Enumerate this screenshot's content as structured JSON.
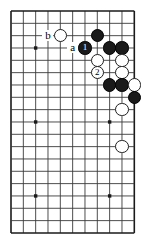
{
  "figure": {
    "kind": "go-board-diagram",
    "background_color": "#ffffff",
    "line_color": "#3a3a3a",
    "edge_color": "#1a1a1a",
    "black_color": "#1a1a1a",
    "white_color": "#ffffff"
  },
  "board": {
    "columns": 11,
    "rows": 19,
    "origin_x": 11,
    "origin_y": 11,
    "spacing": 12.33,
    "edges": {
      "top": true,
      "left": true,
      "right": true,
      "bottom": true
    },
    "star_points": [
      {
        "col": 2,
        "row": 3
      },
      {
        "col": 2,
        "row": 9
      },
      {
        "col": 2,
        "row": 15
      },
      {
        "col": 8,
        "row": 9
      },
      {
        "col": 8,
        "row": 15
      }
    ]
  },
  "stones": [
    {
      "col": 4,
      "row": 2,
      "color": "white",
      "label": ""
    },
    {
      "col": 7,
      "row": 2,
      "color": "black",
      "label": ""
    },
    {
      "col": 6,
      "row": 3,
      "color": "black",
      "label": "1"
    },
    {
      "col": 8,
      "row": 3,
      "color": "black",
      "label": ""
    },
    {
      "col": 9,
      "row": 3,
      "color": "black",
      "label": ""
    },
    {
      "col": 7,
      "row": 4,
      "color": "white",
      "label": ""
    },
    {
      "col": 9,
      "row": 4,
      "color": "white",
      "label": ""
    },
    {
      "col": 7,
      "row": 5,
      "color": "white",
      "label": "2"
    },
    {
      "col": 9,
      "row": 5,
      "color": "white",
      "label": ""
    },
    {
      "col": 8,
      "row": 6,
      "color": "black",
      "label": ""
    },
    {
      "col": 9,
      "row": 6,
      "color": "black",
      "label": ""
    },
    {
      "col": 10,
      "row": 6,
      "color": "white",
      "label": ""
    },
    {
      "col": 10,
      "row": 7,
      "color": "black",
      "label": ""
    },
    {
      "col": 9,
      "row": 8,
      "color": "white",
      "label": ""
    },
    {
      "col": 9,
      "row": 11,
      "color": "white",
      "label": ""
    }
  ],
  "point_labels": [
    {
      "col": 3,
      "row": 2,
      "text": "b"
    },
    {
      "col": 5,
      "row": 3,
      "text": "a"
    }
  ]
}
